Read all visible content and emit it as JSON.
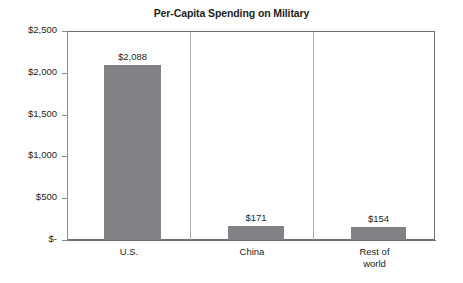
{
  "chart_data": {
    "type": "bar",
    "title": "Per-Capita Spending on Military",
    "xlabel": "",
    "ylabel": "",
    "categories": [
      "U.S.",
      "China",
      "Rest of\nworld"
    ],
    "values": [
      2088,
      171,
      154
    ],
    "value_labels": [
      "$2,088",
      "$171",
      "$154"
    ],
    "ylim": [
      0,
      2500
    ],
    "ytick_values": [
      2500,
      2000,
      1500,
      1000,
      500,
      0
    ],
    "ytick_labels": [
      "$2,500",
      "$2,000",
      "$1,500",
      "$1,000",
      "$500",
      "$-"
    ],
    "grid": false,
    "legend": false,
    "series": [
      {
        "name": "Per-capita military spending",
        "values": [
          2088,
          171,
          154
        ]
      }
    ],
    "colors": {
      "bar_fill": "#808285",
      "axis": "#8b8c8c",
      "separator": "#aeafaf",
      "text": "#231f20",
      "background": "#ffffff"
    }
  }
}
